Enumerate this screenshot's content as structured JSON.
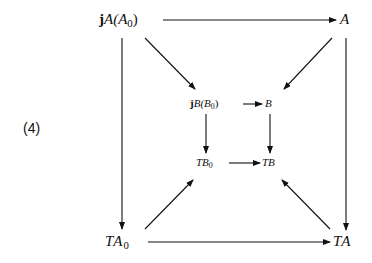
{
  "equation_number": "(4)",
  "nodes": {
    "top_left": {
      "prefix": "j",
      "main": "A(A",
      "sub": "0",
      "suffix": ")"
    },
    "top_right": {
      "main": "A"
    },
    "inner_top_left": {
      "prefix": "j",
      "main": "B(B",
      "sub": "0",
      "suffix": ")"
    },
    "inner_top_right": {
      "main": "B"
    },
    "inner_bottom_left": {
      "main": "TB",
      "sub": "0"
    },
    "inner_bottom_right": {
      "main": "TB"
    },
    "bottom_left": {
      "main": "TA",
      "sub": "0"
    },
    "bottom_right": {
      "main": "TA"
    }
  },
  "arrows": [
    {
      "from": "jA(A0)",
      "to": "A"
    },
    {
      "from": "jA(A0)",
      "to": "TA0"
    },
    {
      "from": "A",
      "to": "TA"
    },
    {
      "from": "TA0",
      "to": "TA"
    },
    {
      "from": "jA(A0)",
      "to": "jB(B0)"
    },
    {
      "from": "A",
      "to": "jB(B0)"
    },
    {
      "from": "TA0",
      "to": "TB0"
    },
    {
      "from": "TA",
      "to": "TB0"
    },
    {
      "from": "jB(B0)",
      "to": "B"
    },
    {
      "from": "jB(B0)",
      "to": "TB0"
    },
    {
      "from": "B",
      "to": "TB"
    },
    {
      "from": "TB0",
      "to": "TB"
    }
  ],
  "colors": {
    "ink": "#111111",
    "background": "#ffffff"
  }
}
